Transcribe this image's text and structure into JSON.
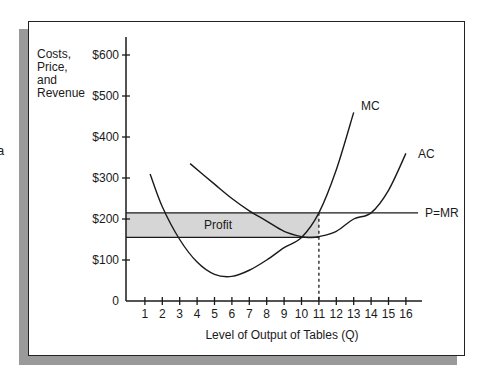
{
  "clipped_fragment": "a",
  "chart_data": {
    "type": "line",
    "title": "",
    "ylabel": [
      "Costs,",
      "Price,",
      "and",
      "Revenue"
    ],
    "xlabel": "Level of Output of Tables (Q)",
    "xlim": [
      0,
      17
    ],
    "ylim": [
      0,
      650
    ],
    "x_ticks": [
      1,
      2,
      3,
      4,
      5,
      6,
      7,
      8,
      9,
      10,
      11,
      12,
      13,
      14,
      15,
      16
    ],
    "y_ticks": [
      {
        "value": 0,
        "label": "0"
      },
      {
        "value": 100,
        "label": "$100"
      },
      {
        "value": 200,
        "label": "$200"
      },
      {
        "value": 300,
        "label": "$300"
      },
      {
        "value": 400,
        "label": "$400"
      },
      {
        "value": 500,
        "label": "$500"
      },
      {
        "value": 600,
        "label": "$600"
      }
    ],
    "grid": false,
    "series": [
      {
        "name": "MC",
        "points": [
          [
            1.3,
            310
          ],
          [
            2,
            230
          ],
          [
            3,
            150
          ],
          [
            4,
            95
          ],
          [
            5,
            65
          ],
          [
            6,
            60
          ],
          [
            7,
            75
          ],
          [
            8,
            100
          ],
          [
            9,
            130
          ],
          [
            10,
            155
          ],
          [
            11,
            215
          ],
          [
            12,
            320
          ],
          [
            13,
            460
          ]
        ]
      },
      {
        "name": "AC",
        "points": [
          [
            3.6,
            335
          ],
          [
            5,
            285
          ],
          [
            6,
            250
          ],
          [
            7,
            220
          ],
          [
            8,
            195
          ],
          [
            9,
            170
          ],
          [
            10,
            157
          ],
          [
            10.5,
            155
          ],
          [
            11,
            157
          ],
          [
            12,
            170
          ],
          [
            13,
            200
          ],
          [
            14,
            215
          ],
          [
            15,
            270
          ],
          [
            16,
            360
          ]
        ]
      },
      {
        "name": "P=MR",
        "points": [
          [
            0,
            215
          ],
          [
            16.7,
            215
          ]
        ]
      }
    ],
    "annotations": [
      {
        "type": "shaded_region",
        "label": "Profit",
        "x": [
          0,
          11
        ],
        "y": [
          155,
          215
        ],
        "color": "#d6d6d6"
      },
      {
        "type": "dashed_vline",
        "x": 11,
        "y": [
          0,
          215
        ]
      }
    ],
    "series_labels": {
      "MC": "MC",
      "AC": "AC",
      "PMR": "P=MR"
    }
  }
}
